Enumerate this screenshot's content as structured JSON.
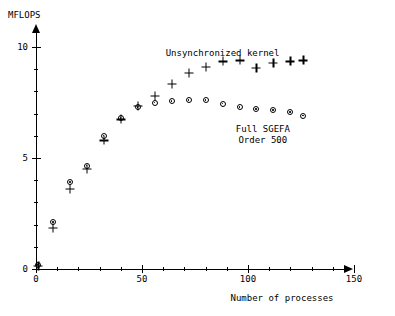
{
  "chart_data": {
    "type": "scatter",
    "title": "",
    "xlabel": "Number of processes",
    "ylabel": "MFLOPS",
    "xlim": [
      0,
      155
    ],
    "ylim": [
      0,
      10.7
    ],
    "xticks_major": [
      0,
      50,
      100,
      150
    ],
    "xticks_minor": [
      10,
      20,
      30,
      40,
      60,
      70,
      80,
      90,
      110,
      120,
      130,
      140
    ],
    "yticks_major": [
      0,
      5,
      10
    ],
    "yticks_minor": [
      1,
      2,
      3,
      4,
      6,
      7,
      8,
      9
    ],
    "grid": false,
    "legend": "none",
    "annotations": [
      {
        "text": "Unsynchronized kernel",
        "x": 88,
        "y": 9.7
      },
      {
        "text": "Full SGEFA",
        "x": 107,
        "y": 6.25
      },
      {
        "text": "Order 500",
        "x": 107,
        "y": 5.75
      }
    ],
    "series": [
      {
        "name": "Unsynchronized kernel",
        "marker": "plus",
        "points": [
          {
            "x": 1,
            "y": 0.15
          },
          {
            "x": 8,
            "y": 1.85
          },
          {
            "x": 16,
            "y": 3.6
          },
          {
            "x": 24,
            "y": 4.5
          },
          {
            "x": 32,
            "y": 5.8
          },
          {
            "x": 40,
            "y": 6.75
          },
          {
            "x": 48,
            "y": 7.35
          },
          {
            "x": 56,
            "y": 7.8
          },
          {
            "x": 64,
            "y": 8.35
          },
          {
            "x": 72,
            "y": 8.85
          },
          {
            "x": 80,
            "y": 9.1
          },
          {
            "x": 88,
            "y": 9.35
          },
          {
            "x": 96,
            "y": 9.4
          },
          {
            "x": 104,
            "y": 9.05
          },
          {
            "x": 112,
            "y": 9.3
          },
          {
            "x": 120,
            "y": 9.35
          },
          {
            "x": 126,
            "y": 9.4
          }
        ]
      },
      {
        "name": "Full SGEFA Order 500",
        "marker": "circle",
        "points": [
          {
            "x": 1,
            "y": 0.2
          },
          {
            "x": 8,
            "y": 2.1
          },
          {
            "x": 16,
            "y": 3.9
          },
          {
            "x": 24,
            "y": 4.65
          },
          {
            "x": 32,
            "y": 6.0
          },
          {
            "x": 40,
            "y": 6.8
          },
          {
            "x": 48,
            "y": 7.3
          },
          {
            "x": 56,
            "y": 7.5
          },
          {
            "x": 64,
            "y": 7.55
          },
          {
            "x": 72,
            "y": 7.6
          },
          {
            "x": 80,
            "y": 7.6
          },
          {
            "x": 88,
            "y": 7.45
          },
          {
            "x": 96,
            "y": 7.3
          },
          {
            "x": 104,
            "y": 7.2
          },
          {
            "x": 112,
            "y": 7.15
          },
          {
            "x": 120,
            "y": 7.05
          },
          {
            "x": 126,
            "y": 6.9
          }
        ]
      }
    ]
  },
  "axis": {
    "x_label": "Number of processes",
    "y_label": "MFLOPS"
  }
}
